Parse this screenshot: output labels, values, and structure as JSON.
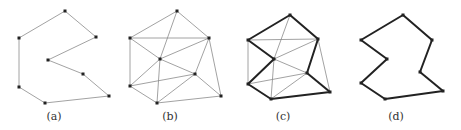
{
  "figure": {
    "panels": [
      {
        "id": "a",
        "label": "(a)",
        "label_pos": [
          54,
          120
        ],
        "points": [
          [
            65,
            11
          ],
          [
            96,
            37
          ],
          [
            48,
            60
          ],
          [
            83,
            74
          ],
          [
            109,
            96
          ],
          [
            45,
            103
          ],
          [
            19,
            87
          ],
          [
            19,
            38
          ]
        ],
        "thin_edges": [
          [
            0,
            1
          ],
          [
            1,
            2
          ],
          [
            2,
            3
          ],
          [
            3,
            4
          ],
          [
            4,
            5
          ],
          [
            5,
            6
          ],
          [
            6,
            7
          ],
          [
            7,
            0
          ]
        ],
        "thick_edges": []
      },
      {
        "id": "b",
        "label": "(b)",
        "label_pos": [
          170,
          120
        ],
        "points": [
          [
            177,
            11
          ],
          [
            130,
            38
          ],
          [
            209,
            38
          ],
          [
            160,
            59
          ],
          [
            195,
            74
          ],
          [
            221,
            96
          ],
          [
            130,
            86
          ],
          [
            157,
            103
          ]
        ],
        "thin_edges": [
          [
            0,
            1
          ],
          [
            0,
            2
          ],
          [
            0,
            3
          ],
          [
            1,
            2
          ],
          [
            1,
            3
          ],
          [
            1,
            6
          ],
          [
            2,
            3
          ],
          [
            2,
            4
          ],
          [
            2,
            5
          ],
          [
            3,
            4
          ],
          [
            3,
            6
          ],
          [
            3,
            7
          ],
          [
            4,
            6
          ],
          [
            4,
            7
          ],
          [
            4,
            5
          ],
          [
            6,
            7
          ],
          [
            7,
            5
          ]
        ],
        "thick_edges": []
      },
      {
        "id": "c",
        "label": "(c)",
        "label_pos": [
          283,
          120
        ],
        "points": [
          [
            290,
            15
          ],
          [
            248,
            40
          ],
          [
            318,
            39
          ],
          [
            274,
            59
          ],
          [
            307,
            73
          ],
          [
            330,
            92
          ],
          [
            248,
            84
          ],
          [
            271,
            99
          ]
        ],
        "thin_edges": [
          [
            0,
            3
          ],
          [
            1,
            2
          ],
          [
            1,
            6
          ],
          [
            2,
            3
          ],
          [
            2,
            5
          ],
          [
            3,
            4
          ],
          [
            3,
            7
          ],
          [
            4,
            6
          ],
          [
            4,
            7
          ]
        ],
        "thick_edges": [
          [
            0,
            1
          ],
          [
            0,
            2
          ],
          [
            1,
            3
          ],
          [
            3,
            6
          ],
          [
            6,
            7
          ],
          [
            7,
            5
          ],
          [
            5,
            4
          ],
          [
            4,
            2
          ]
        ]
      },
      {
        "id": "d",
        "label": "(d)",
        "label_pos": [
          396,
          120
        ],
        "points": [
          [
            403,
            15
          ],
          [
            361,
            40
          ],
          [
            432,
            40
          ],
          [
            387,
            59
          ],
          [
            420,
            72
          ],
          [
            443,
            91
          ],
          [
            361,
            83
          ],
          [
            385,
            99
          ]
        ],
        "thin_edges": [],
        "thick_edges": [
          [
            0,
            1
          ],
          [
            0,
            2
          ],
          [
            1,
            3
          ],
          [
            3,
            6
          ],
          [
            6,
            7
          ],
          [
            7,
            5
          ],
          [
            5,
            4
          ],
          [
            4,
            2
          ]
        ]
      }
    ],
    "colors": {
      "thin_edge": "#8a8a8a",
      "thick_edge": "#222222",
      "vertex": "#222222",
      "label": "#333333"
    }
  }
}
